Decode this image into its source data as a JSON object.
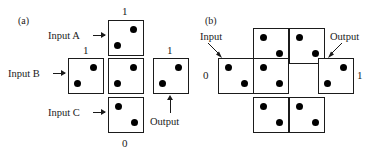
{
  "figure": {
    "width": 387,
    "height": 152,
    "background": "#ffffff",
    "ink": "#1a1a1a",
    "pip_color": "#000000"
  },
  "panels": [
    {
      "id": "a",
      "label": "(a)",
      "description": "Three-input logic gate built from domino/die cells arranged in a plus shape",
      "dice": [
        {
          "name": "input-a-cell",
          "pips": "anti-diagonal",
          "x": 108,
          "y": 20,
          "bit_above": "1"
        },
        {
          "name": "input-b-cell",
          "pips": "anti-diagonal",
          "x": 68,
          "y": 58,
          "bit_above": "1"
        },
        {
          "name": "center-cell",
          "pips": "anti-diagonal",
          "x": 108,
          "y": 58,
          "bit_above": ""
        },
        {
          "name": "output-cell",
          "pips": "anti-diagonal",
          "x": 153,
          "y": 58,
          "bit_above": "1"
        },
        {
          "name": "input-c-cell",
          "pips": "main-diagonal",
          "x": 108,
          "y": 97,
          "bit_below": "0"
        }
      ],
      "labels": {
        "input_a": "Input A",
        "input_b": "Input B",
        "input_c": "Input C",
        "output": "Output",
        "bit_top": "1",
        "bit_left": "1",
        "bit_right": "1",
        "bit_bottom": "0"
      }
    },
    {
      "id": "b",
      "label": "(b)",
      "description": "Staircase array of die cells propagating an input bit to an output bit",
      "dice": [
        {
          "name": "top-left-cell",
          "pips": "main-diagonal",
          "x": 253,
          "y": 28
        },
        {
          "name": "top-right-cell",
          "pips": "main-diagonal",
          "x": 289,
          "y": 28
        },
        {
          "name": "input-cell",
          "pips": "main-diagonal",
          "x": 218,
          "y": 58
        },
        {
          "name": "middle-cell",
          "pips": "main-diagonal",
          "x": 253,
          "y": 58
        },
        {
          "name": "output-cell",
          "pips": "anti-diagonal",
          "x": 318,
          "y": 58
        },
        {
          "name": "bottom-left-cell",
          "pips": "main-diagonal",
          "x": 253,
          "y": 97
        },
        {
          "name": "bottom-right-cell",
          "pips": "main-diagonal",
          "x": 289,
          "y": 97
        }
      ],
      "labels": {
        "input": "Input",
        "output": "Output",
        "bit_input": "0",
        "bit_output": "1"
      }
    }
  ]
}
